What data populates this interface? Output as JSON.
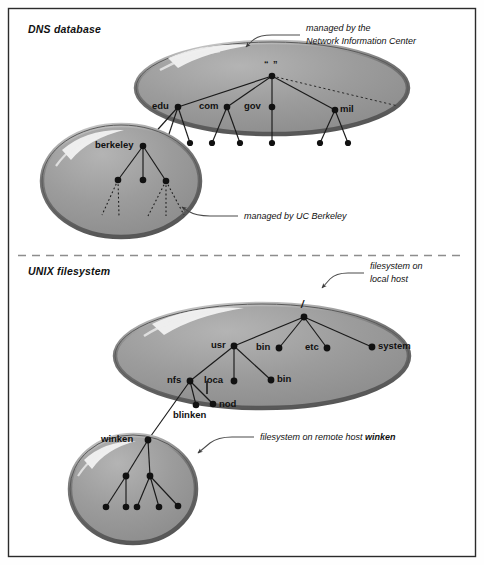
{
  "figure": {
    "border_color": "#2b2b2b",
    "background": "#ffffff",
    "blob_fill": "#9a9a9a",
    "blob_stroke": "#4f4f4f",
    "blob_highlight": "#f2f2f2",
    "line_color": "#1a1a1a",
    "divider_color": "#8a8a8a",
    "label_color": "#111111"
  },
  "sections": [
    {
      "id": "dns",
      "title": "DNS database"
    },
    {
      "id": "unix",
      "title": "UNIX filesystem"
    }
  ],
  "annotations": [
    {
      "id": "nic",
      "lines": [
        "managed by the",
        "Network Information Center"
      ],
      "bold_tail": "",
      "target": "dns-root-blob"
    },
    {
      "id": "ucb",
      "lines": [
        "managed by UC Berkeley"
      ],
      "bold_tail": "",
      "target": "berkeley-blob"
    },
    {
      "id": "localhost",
      "lines": [
        "filesystem on",
        "local host"
      ],
      "bold_tail": "",
      "target": "unix-root-blob"
    },
    {
      "id": "remotehost",
      "lines": [
        "filesystem on remote host "
      ],
      "bold_tail": "winken",
      "target": "winken-blob"
    }
  ],
  "blobs": [
    {
      "id": "dns-root-blob",
      "section": "dns",
      "label": "DNS root zone"
    },
    {
      "id": "berkeley-blob",
      "section": "dns",
      "label": "berkeley.edu zone"
    },
    {
      "id": "unix-root-blob",
      "section": "unix",
      "label": "local host filesystem"
    },
    {
      "id": "winken-blob",
      "section": "unix",
      "label": "winken filesystem"
    }
  ],
  "trees": {
    "dns_root": {
      "root_label": "“ ”",
      "nodes": [
        "edu",
        "com",
        "gov",
        "mil"
      ],
      "unlabeled_leaf_count": 7,
      "dashed_continuation": true
    },
    "berkeley": {
      "root_label": "berkeley",
      "child_count": 3,
      "dotted_descendants": true
    },
    "unix_root": {
      "root_label": "/",
      "level1": [
        "usr",
        "bin",
        "etc",
        "system"
      ],
      "usr_children": [
        "nfs",
        "loca",
        "bin"
      ],
      "nfs_children": [
        "blinken",
        "nod"
      ]
    },
    "winken": {
      "root_label": "winken",
      "child_count": 2,
      "leaf_count": 5
    }
  },
  "labels": {
    "dns_root": "“ ”",
    "edu": "edu",
    "com": "com",
    "gov": "gov",
    "mil": "mil",
    "berkeley": "berkeley",
    "slash": "/",
    "usr": "usr",
    "bin_top": "bin",
    "etc": "etc",
    "system": "system",
    "nfs": "nfs",
    "loca": "loca",
    "bin_usr": "bin",
    "blinken": "blinken",
    "nod": "nod",
    "winken": "winken"
  }
}
